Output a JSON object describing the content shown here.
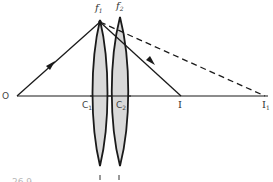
{
  "diagram": {
    "type": "optics-ray-diagram",
    "colors": {
      "line": "#1a1a1a",
      "lens_fill": "#d9d9d9",
      "lens_stroke": "#1a1a1a",
      "label": "#333333",
      "faint_text": "#b8b8b8"
    },
    "labels": {
      "object": "O",
      "lens1_focus": {
        "base": "f",
        "sub": "1"
      },
      "lens2_focus": {
        "base": "f",
        "sub": "2"
      },
      "center1": {
        "base": "C",
        "sub": "1"
      },
      "center2": {
        "base": "C",
        "sub": "2"
      },
      "image": "I",
      "image1": {
        "base": "I",
        "sub": "1"
      },
      "figure_number": "26.9"
    },
    "elements": {
      "optical_axis": {
        "x1": 17,
        "y1": 96,
        "x2": 268,
        "y2": 96
      },
      "lens1": {
        "cx": 100,
        "top": 20,
        "bottom": 166,
        "half_width": 7
      },
      "lens2": {
        "cx": 120,
        "top": 17,
        "bottom": 166,
        "half_width": 8
      },
      "incident_ray": {
        "x1": 17,
        "y1": 96,
        "x2": 100,
        "y2": 22,
        "arrow_at": [
          51,
          65
        ]
      },
      "refracted_ray": {
        "x1": 100,
        "y1": 22,
        "x2": 181,
        "y2": 96,
        "arrow_at": [
          152,
          61
        ]
      },
      "dashed_ray": {
        "x1": 100,
        "y1": 22,
        "x2": 265,
        "y2": 96
      }
    }
  }
}
